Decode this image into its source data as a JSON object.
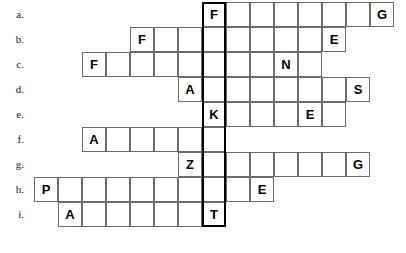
{
  "puzzle": {
    "type": "crossword-word-ladder",
    "title": "",
    "cell_size": 24,
    "row_height": 25,
    "grid_origin_x": 10,
    "grid_origin_y": 2,
    "highlight_column_index": 8,
    "highlight_border_color": "#000000",
    "cell_border_color": "#6b6b6b",
    "cell_background": "#ffffff",
    "letter_color": "#000000",
    "label_color": "#1a1a1a",
    "rows": [
      {
        "label": "a.",
        "start_col": 8,
        "length": 8,
        "letters": [
          "F",
          "",
          "",
          "",
          "",
          "",
          "",
          "G"
        ]
      },
      {
        "label": "b.",
        "start_col": 5,
        "length": 9,
        "letters": [
          "F",
          "",
          "",
          "",
          "",
          "",
          "",
          "",
          "E"
        ]
      },
      {
        "label": "c.",
        "start_col": 3,
        "length": 10,
        "letters": [
          "F",
          "",
          "",
          "",
          "",
          "",
          "",
          "",
          "N",
          ""
        ]
      },
      {
        "label": "d.",
        "start_col": 7,
        "length": 8,
        "letters": [
          "A",
          "",
          "",
          "",
          "",
          "",
          "",
          "S"
        ]
      },
      {
        "label": "e.",
        "start_col": 8,
        "length": 6,
        "letters": [
          "K",
          "",
          "",
          "",
          "E",
          ""
        ]
      },
      {
        "label": "f.",
        "start_col": 3,
        "length": 6,
        "letters": [
          "A",
          "",
          "",
          "",
          "",
          ""
        ]
      },
      {
        "label": "g.",
        "start_col": 7,
        "length": 8,
        "letters": [
          "Z",
          "",
          "",
          "",
          "",
          "",
          "",
          "G"
        ]
      },
      {
        "label": "h.",
        "start_col": 1,
        "length": 10,
        "letters": [
          "P",
          "",
          "",
          "",
          "",
          "",
          "",
          "",
          "",
          "E"
        ]
      },
      {
        "label": "i.",
        "start_col": 2,
        "length": 7,
        "letters": [
          "A",
          "",
          "",
          "",
          "",
          "",
          "T"
        ]
      }
    ]
  }
}
